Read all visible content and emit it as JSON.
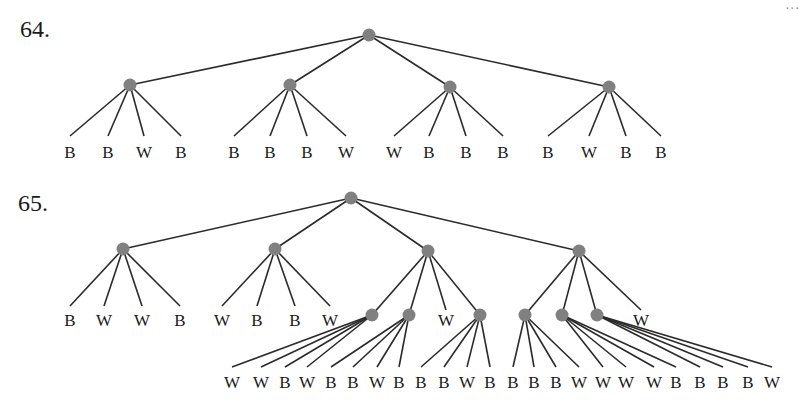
{
  "corner_mark": "...",
  "colors": {
    "node": "#808080",
    "edge": "#2a2a2a",
    "text": "#1a1a1a"
  },
  "problems": [
    {
      "number": "64.",
      "label_pos": [
        20,
        16
      ],
      "root": {
        "x": 369,
        "y": 35
      },
      "children": [
        {
          "x": 130,
          "y": 85,
          "leaves": [
            {
              "label": "B",
              "x": 70
            },
            {
              "label": "B",
              "x": 108
            },
            {
              "label": "W",
              "x": 144
            },
            {
              "label": "B",
              "x": 181
            }
          ]
        },
        {
          "x": 290,
          "y": 85,
          "leaves": [
            {
              "label": "B",
              "x": 234
            },
            {
              "label": "B",
              "x": 270
            },
            {
              "label": "B",
              "x": 307
            },
            {
              "label": "W",
              "x": 346
            }
          ]
        },
        {
          "x": 450,
          "y": 87,
          "leaves": [
            {
              "label": "W",
              "x": 394
            },
            {
              "label": "B",
              "x": 429
            },
            {
              "label": "B",
              "x": 466
            },
            {
              "label": "B",
              "x": 503
            }
          ]
        },
        {
          "x": 609,
          "y": 87,
          "leaves": [
            {
              "label": "B",
              "x": 548
            },
            {
              "label": "W",
              "x": 589
            },
            {
              "label": "B",
              "x": 626
            },
            {
              "label": "B",
              "x": 661
            }
          ]
        }
      ],
      "leaf_line_end_y": 136,
      "leaf_label_y": 144
    },
    {
      "number": "65.",
      "label_pos": [
        18,
        190
      ],
      "root": {
        "x": 351,
        "y": 198
      },
      "children": [
        {
          "x": 123,
          "y": 249,
          "leaves": [
            {
              "label": "B",
              "x": 70
            },
            {
              "label": "W",
              "x": 104
            },
            {
              "label": "W",
              "x": 142
            },
            {
              "label": "B",
              "x": 180
            }
          ]
        },
        {
          "x": 275,
          "y": 249,
          "leaves": [
            {
              "label": "W",
              "x": 222
            },
            {
              "label": "B",
              "x": 257
            },
            {
              "label": "B",
              "x": 295
            },
            {
              "label": "W",
              "x": 330
            }
          ]
        },
        {
          "x": 428,
          "y": 251,
          "subnodes": [
            {
              "type": "node",
              "x": 372,
              "y": 315,
              "leaves": [
                {
                  "label": "W",
                  "x": 232
                },
                {
                  "label": "W",
                  "x": 261
                },
                {
                  "label": "B",
                  "x": 285
                },
                {
                  "label": "W",
                  "x": 307
                }
              ]
            },
            {
              "type": "node",
              "x": 409,
              "y": 315,
              "leaves": [
                {
                  "label": "B",
                  "x": 331
                },
                {
                  "label": "B",
                  "x": 353
                },
                {
                  "label": "W",
                  "x": 377
                },
                {
                  "label": "B",
                  "x": 399
                }
              ]
            },
            {
              "type": "leaf",
              "label": "W",
              "x": 446,
              "y": 318
            },
            {
              "type": "node",
              "x": 480,
              "y": 315,
              "leaves": [
                {
                  "label": "B",
                  "x": 421
                },
                {
                  "label": "B",
                  "x": 444
                },
                {
                  "label": "W",
                  "x": 467
                },
                {
                  "label": "B",
                  "x": 490
                }
              ]
            }
          ]
        },
        {
          "x": 579,
          "y": 251,
          "subnodes": [
            {
              "type": "node",
              "x": 525,
              "y": 315,
              "leaves": [
                {
                  "label": "B",
                  "x": 513
                },
                {
                  "label": "B",
                  "x": 534
                },
                {
                  "label": "B",
                  "x": 556
                },
                {
                  "label": "W",
                  "x": 579
                }
              ]
            },
            {
              "type": "node",
              "x": 562,
              "y": 315,
              "leaves": [
                {
                  "label": "W",
                  "x": 603
                },
                {
                  "label": "W",
                  "x": 626
                },
                {
                  "label": "W",
                  "x": 654
                },
                {
                  "label": "B",
                  "x": 676
                }
              ]
            },
            {
              "type": "node",
              "x": 597,
              "y": 315,
              "leaves": [
                {
                  "label": "B",
                  "x": 700
                },
                {
                  "label": "B",
                  "x": 723
                },
                {
                  "label": "B",
                  "x": 748
                },
                {
                  "label": "W",
                  "x": 772
                }
              ]
            },
            {
              "type": "leaf",
              "label": "W",
              "x": 641,
              "y": 318
            }
          ]
        }
      ],
      "leaf_line_end_y_l2": 306,
      "leaf_label_y_l2": 312,
      "leaf_line_end_y_l3": 367,
      "leaf_label_y_l3": 374
    }
  ]
}
